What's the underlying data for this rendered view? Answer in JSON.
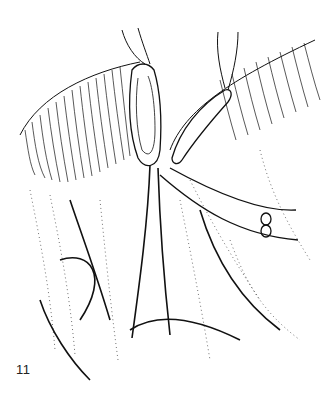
{
  "figure": {
    "number": "11",
    "colors": {
      "ink": "#111111",
      "background": "#ffffff"
    }
  }
}
